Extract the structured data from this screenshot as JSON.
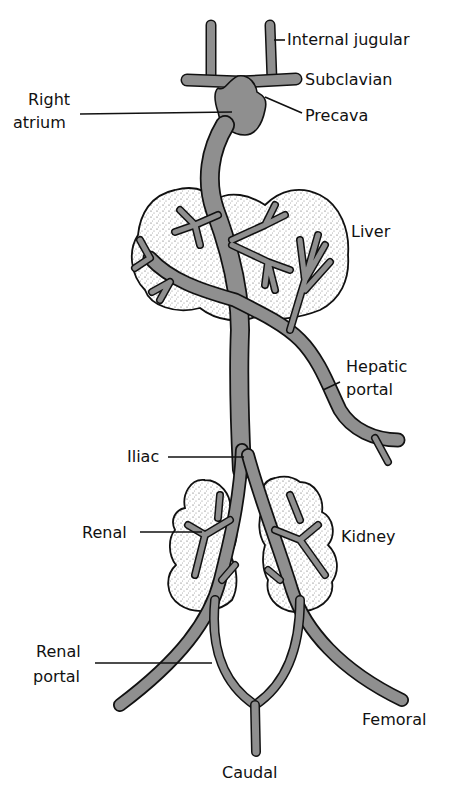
{
  "diagram": {
    "type": "anatomical-venous-system",
    "colors": {
      "vein_fill": "#8f8f8f",
      "outline": "#111111",
      "organ_stipple": "#cfcfcf",
      "background": "#ffffff"
    },
    "labels": {
      "internal_jugular": "Internal jugular",
      "subclavian": "Subclavian",
      "right_atrium_line1": "Right",
      "right_atrium_line2": "atrium",
      "precava": "Precava",
      "liver": "Liver",
      "hepatic_portal_line1": "Hepatic",
      "hepatic_portal_line2": "portal",
      "iliac": "Iliac",
      "renal": "Renal",
      "kidney": "Kidney",
      "renal_portal_line1": "Renal",
      "renal_portal_line2": "portal",
      "femoral": "Femoral",
      "caudal": "Caudal"
    }
  }
}
